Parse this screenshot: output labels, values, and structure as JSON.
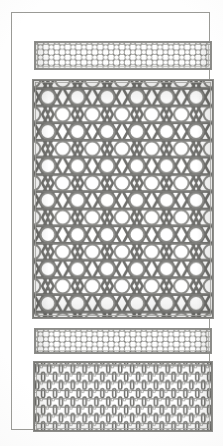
{
  "plate": {
    "title": "Ornamental Lattice Plate",
    "medium": "engraved line plate",
    "background_color": "#fefefe",
    "ink_color": "#6f6f6c",
    "frame": {
      "name": "outer-rule-frame",
      "stroke_color": "#9a9a96",
      "stroke_width": 1
    },
    "panels": [
      {
        "id": "band-top",
        "label": "narrow interlace band",
        "pattern": "diagonal-lattice-with-round-openings",
        "border_color": "#8d8d8a",
        "fill_color": "#ffffff",
        "ink_color": "#7a7a77",
        "cell_size": 11,
        "rows": 2,
        "columns": 16
      },
      {
        "id": "main-panel",
        "label": "hexagonal star lattice field",
        "pattern": "triangular-hexagon-star-interlace",
        "border_color": "#8d8d8a",
        "fill_color": "#ffffff",
        "ink_color": "#6f6f6c",
        "cell_size": 30,
        "rows": 8,
        "columns": 6
      },
      {
        "id": "band-mid",
        "label": "narrow interlace band",
        "pattern": "diagonal-lattice-with-round-openings",
        "border_color": "#8d8d8a",
        "fill_color": "#ffffff",
        "ink_color": "#7a7a77",
        "cell_size": 11,
        "rows": 2,
        "columns": 16
      },
      {
        "id": "bottom-panel",
        "label": "rectangular basketweave lattice",
        "pattern": "brick-basketweave-with-slot-openings",
        "border_color": "#8d8d8a",
        "fill_color": "#ffffff",
        "ink_color": "#757572",
        "cell_width": 12,
        "cell_height": 17,
        "rows": 4,
        "columns": 15
      }
    ]
  }
}
